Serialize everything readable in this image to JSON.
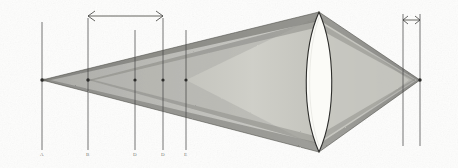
{
  "figure": {
    "type": "line-diagram",
    "background_color": "#fdfdfc",
    "ink_color": "#3a3a38",
    "paper_texture": true,
    "width": 458,
    "height": 168
  },
  "optical_axis": {
    "label": "optical-axis",
    "y": 80,
    "x_start": 8,
    "x_end": 452,
    "color": "#3c3c3a"
  },
  "lens": {
    "label": "biconvex-lens",
    "center_x": 319,
    "top_y": 12,
    "bottom_y": 152,
    "half_width": 18,
    "fill": "#fbfbf8",
    "stroke": "#2e2e2c"
  },
  "vertices": [
    {
      "name": "left-focus",
      "x": 42,
      "y": 80
    },
    {
      "name": "right-focus",
      "x": 420,
      "y": 80
    }
  ],
  "station_lines": [
    {
      "label": "A",
      "x": 42,
      "top_y": 22,
      "bottom_y": 150,
      "label_y": 156
    },
    {
      "label": "B",
      "x": 88,
      "top_y": 22,
      "bottom_y": 150,
      "label_y": 156
    },
    {
      "label": "D",
      "x": 135,
      "top_y": 30,
      "bottom_y": 150,
      "label_y": 156
    },
    {
      "label": "D",
      "x": 163,
      "top_y": 22,
      "bottom_y": 150,
      "label_y": 156
    },
    {
      "label": "E",
      "x": 186,
      "top_y": 30,
      "bottom_y": 150,
      "label_y": 156
    }
  ],
  "right_station_lines": [
    {
      "name": "right-rule-inner",
      "x": 403,
      "top_y": 14,
      "bottom_y": 146
    },
    {
      "name": "right-rule-outer",
      "x": 420,
      "top_y": 14,
      "bottom_y": 146
    }
  ],
  "dimension_arrows": [
    {
      "name": "main-span-arrow",
      "x_start": 88,
      "x_end": 163,
      "y": 16
    },
    {
      "name": "right-span-arrow",
      "x_start": 403,
      "x_end": 420,
      "y": 20
    }
  ],
  "beams": [
    {
      "name": "outer-beam",
      "tone": "#9d9d98",
      "opacity": 0.85
    },
    {
      "name": "mid-beam",
      "tone": "#b4b4ae",
      "opacity": 0.8
    },
    {
      "name": "inner-beam",
      "tone": "#cfcfc8",
      "opacity": 0.85
    },
    {
      "name": "edge-band",
      "tone": "#6e6e6a",
      "opacity": 0.7
    }
  ],
  "colors": {
    "ink": "#3a3a38",
    "paper": "#fdfdfc",
    "beam_dark": "#7c7c77",
    "beam_mid": "#a9a9a3",
    "beam_light": "#c9c9c2",
    "label_gray": "#7d7d79"
  }
}
